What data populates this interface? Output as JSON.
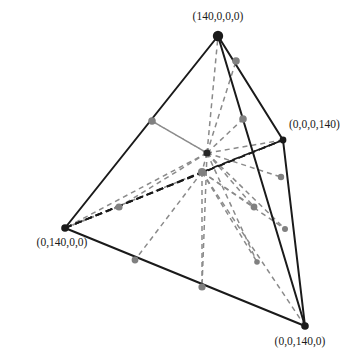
{
  "figure": {
    "type": "diagram",
    "width": 356,
    "height": 362,
    "background_color": "#ffffff"
  },
  "colors": {
    "edge_solid": "#1a1a1a",
    "edge_dashed_dark": "#1a1a1a",
    "ray_dashed_gray": "#8a8a8a",
    "vertex_fill": "#1a1a1a",
    "point_gray": "#808080",
    "center_fill": "#262626",
    "label_text": "#1a1a1a"
  },
  "vertices": [
    {
      "id": "v-top",
      "label": "(140,0,0,0)",
      "x": 218,
      "y": 36,
      "r": 5.2,
      "label_x": 218,
      "label_y": 20,
      "label_anchor": "middle"
    },
    {
      "id": "v-right",
      "label": "(0,0,0,140)",
      "x": 283,
      "y": 140,
      "r": 3.4,
      "label_x": 289,
      "label_y": 128,
      "label_anchor": "start"
    },
    {
      "id": "v-left",
      "label": "(0,140,0,0)",
      "x": 65,
      "y": 228,
      "r": 3.8,
      "label_x": 62,
      "label_y": 246,
      "label_anchor": "middle"
    },
    {
      "id": "v-bottom-right",
      "label": "(0,0,140,0)",
      "x": 305,
      "y": 326,
      "r": 3.8,
      "label_x": 300,
      "label_y": 345,
      "label_anchor": "middle"
    }
  ],
  "solid_edges": [
    {
      "id": "edge-top-left",
      "x1": 218,
      "y1": 36,
      "x2": 65,
      "y2": 228
    },
    {
      "id": "edge-top-right",
      "x1": 218,
      "y1": 36,
      "x2": 283,
      "y2": 140
    },
    {
      "id": "edge-top-bottomright",
      "x1": 218,
      "y1": 36,
      "x2": 305,
      "y2": 326
    },
    {
      "id": "edge-left-bottomright",
      "x1": 65,
      "y1": 228,
      "x2": 305,
      "y2": 326
    },
    {
      "id": "edge-right-bottomright",
      "x1": 283,
      "y1": 140,
      "x2": 305,
      "y2": 326
    }
  ],
  "dashed_edges": [
    {
      "id": "edge-left-right-hidden",
      "x1": 65,
      "y1": 228,
      "x2": 283,
      "y2": 140
    }
  ],
  "center": {
    "id": "centroid",
    "x": 207,
    "y": 153,
    "r": 3.6
  },
  "secondary_center": {
    "id": "sub-centroid",
    "x": 202,
    "y": 172,
    "r": 4.0
  },
  "gray_points": [
    {
      "id": "pt-edge-top-left",
      "x": 152,
      "y": 121,
      "r": 3.8
    },
    {
      "id": "pt-edge-top-right",
      "x": 236,
      "y": 61,
      "r": 3.8
    },
    {
      "id": "pt-edge-top-bottomright",
      "x": 243,
      "y": 119,
      "r": 3.8
    },
    {
      "id": "pt-interior-upper-right",
      "x": 281,
      "y": 177,
      "r": 3.2
    },
    {
      "id": "pt-interior-mid-right",
      "x": 254,
      "y": 207,
      "r": 3.4
    },
    {
      "id": "pt-interior-low-right",
      "x": 285,
      "y": 229,
      "r": 3.0
    },
    {
      "id": "pt-interior-bottom",
      "x": 257,
      "y": 262,
      "r": 2.8
    },
    {
      "id": "pt-interior-left",
      "x": 119,
      "y": 207,
      "r": 3.6
    },
    {
      "id": "pt-edge-bottom-left",
      "x": 135,
      "y": 260,
      "r": 3.4
    },
    {
      "id": "pt-edge-bottom-mid",
      "x": 202,
      "y": 287,
      "r": 3.6
    }
  ],
  "gray_rays": [
    {
      "id": "ray-center-to-top",
      "x1": 207,
      "y1": 153,
      "x2": 218,
      "y2": 36
    },
    {
      "id": "ray-center-to-top-right-pt",
      "x1": 207,
      "y1": 153,
      "x2": 236,
      "y2": 61
    },
    {
      "id": "ray-center-to-edge-pt-tr",
      "x1": 207,
      "y1": 153,
      "x2": 243,
      "y2": 119
    },
    {
      "id": "ray-center-to-edge-pt-tl",
      "x1": 207,
      "y1": 153,
      "x2": 152,
      "y2": 121
    },
    {
      "id": "ray-center-to-right-vertex",
      "x1": 207,
      "y1": 153,
      "x2": 283,
      "y2": 140
    },
    {
      "id": "ray-center-to-left-vertex",
      "x1": 207,
      "y1": 153,
      "x2": 65,
      "y2": 228
    },
    {
      "id": "ray-center-to-int-left",
      "x1": 207,
      "y1": 153,
      "x2": 119,
      "y2": 207
    },
    {
      "id": "ray-center-to-int-up-right",
      "x1": 207,
      "y1": 153,
      "x2": 281,
      "y2": 177
    },
    {
      "id": "ray-center-to-int-mid-right",
      "x1": 207,
      "y1": 153,
      "x2": 254,
      "y2": 207
    },
    {
      "id": "ray-center-to-int-low-right",
      "x1": 207,
      "y1": 153,
      "x2": 285,
      "y2": 229
    },
    {
      "id": "ray-center-to-int-bottom",
      "x1": 207,
      "y1": 153,
      "x2": 257,
      "y2": 262
    },
    {
      "id": "ray-center-to-bottom-mid",
      "x1": 207,
      "y1": 153,
      "x2": 202,
      "y2": 287
    },
    {
      "id": "ray-center-to-sub",
      "x1": 207,
      "y1": 153,
      "x2": 202,
      "y2": 172
    },
    {
      "id": "ray-sub-to-int-mid-right",
      "x1": 202,
      "y1": 172,
      "x2": 254,
      "y2": 207
    },
    {
      "id": "ray-sub-to-int-low-right",
      "x1": 202,
      "y1": 172,
      "x2": 285,
      "y2": 229
    },
    {
      "id": "ray-sub-to-int-bottom",
      "x1": 202,
      "y1": 172,
      "x2": 257,
      "y2": 262
    },
    {
      "id": "ray-sub-to-bottom-left-pt",
      "x1": 202,
      "y1": 172,
      "x2": 135,
      "y2": 260
    },
    {
      "id": "ray-sub-to-bottom-mid-pt",
      "x1": 202,
      "y1": 172,
      "x2": 202,
      "y2": 287
    },
    {
      "id": "ray-sub-to-bottomright-v",
      "x1": 202,
      "y1": 172,
      "x2": 305,
      "y2": 326
    },
    {
      "id": "ray-sub-to-left-vertex",
      "x1": 202,
      "y1": 172,
      "x2": 65,
      "y2": 228
    },
    {
      "id": "ray-edge-pt-tl-to-int-left",
      "x1": 152,
      "y1": 121,
      "x2": 207,
      "y2": 153
    },
    {
      "id": "ray-int-left-to-left-vertex",
      "x1": 119,
      "y1": 207,
      "x2": 65,
      "y2": 228
    }
  ],
  "dark_dashed_rays": [
    {
      "id": "dash-left-to-right-vertex",
      "x1": 65,
      "y1": 228,
      "x2": 283,
      "y2": 140
    },
    {
      "id": "dash-left-to-sub-center",
      "x1": 65,
      "y1": 228,
      "x2": 202,
      "y2": 172
    },
    {
      "id": "dash-sub-to-right-vertex",
      "x1": 202,
      "y1": 172,
      "x2": 283,
      "y2": 140
    }
  ]
}
